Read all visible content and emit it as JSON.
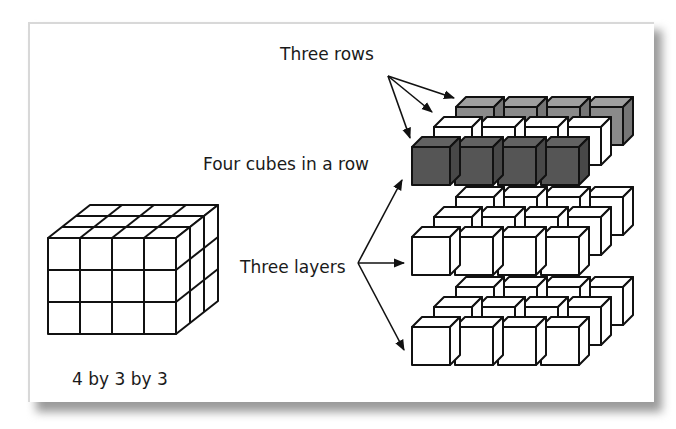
{
  "labels": {
    "three_rows": "Three rows",
    "four_cubes": "Four cubes in a row",
    "three_layers": "Three layers",
    "dimensions": "4 by 3 by 3"
  },
  "colors": {
    "dark_cube": "#555555",
    "gray_cube": "#8a8a8a",
    "white_cube": "#ffffff",
    "outline": "#111111"
  },
  "prism": {
    "cols": 4,
    "rows": 3,
    "layers": 3
  }
}
